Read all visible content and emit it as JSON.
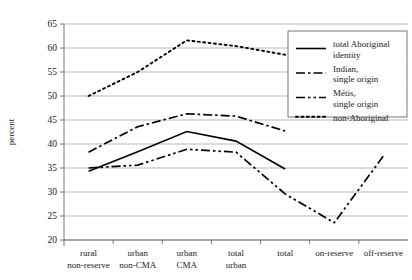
{
  "chart_data": {
    "type": "line",
    "title": "",
    "xlabel": "",
    "ylabel": "percent",
    "ylim": [
      20,
      65
    ],
    "ytick_step": 5,
    "yticks": [
      "20",
      "25",
      "30",
      "35",
      "40",
      "45",
      "50",
      "55",
      "60",
      "65"
    ],
    "grid": true,
    "legend_position": "right-top",
    "categories": [
      "rural non-reserve",
      "urban non-CMA",
      "urban CMA",
      "total urban",
      "total",
      "on-reserve",
      "off-reserve"
    ],
    "category_lines": [
      [
        "rural",
        "non-reserve"
      ],
      [
        "urban",
        "non-CMA"
      ],
      [
        "urban",
        "CMA"
      ],
      [
        "total",
        "urban"
      ],
      [
        "total",
        ""
      ],
      [
        "on-reserve",
        ""
      ],
      [
        "off-reserve",
        ""
      ]
    ],
    "series": [
      {
        "name": "total Aboriginal identity",
        "legend_lines": [
          "total Aboriginal",
          "identity"
        ],
        "style": "solid",
        "values": [
          34.3,
          38.4,
          42.6,
          40.6,
          34.8,
          null,
          null
        ]
      },
      {
        "name": "Indian, single origin",
        "legend_lines": [
          "Indian,",
          "single origin"
        ],
        "style": "dash-dot",
        "values": [
          38.3,
          43.6,
          46.3,
          45.8,
          42.7,
          null,
          null
        ]
      },
      {
        "name": "Métis, single origin",
        "legend_lines": [
          "Métis,",
          "single origin"
        ],
        "style": "dash-dot-dot",
        "values": [
          35.0,
          35.6,
          38.9,
          38.3,
          29.6,
          23.6,
          37.5
        ]
      },
      {
        "name": "non-Aboriginal",
        "legend_lines": [
          "non-Aboriginal"
        ],
        "style": "dotted",
        "values": [
          50.0,
          55.0,
          61.6,
          60.4,
          58.6,
          null,
          null
        ]
      }
    ]
  },
  "colors": {
    "series": "#000000",
    "grid": "#9a9a9a",
    "axis": "#555555",
    "background": "#ffffff"
  }
}
